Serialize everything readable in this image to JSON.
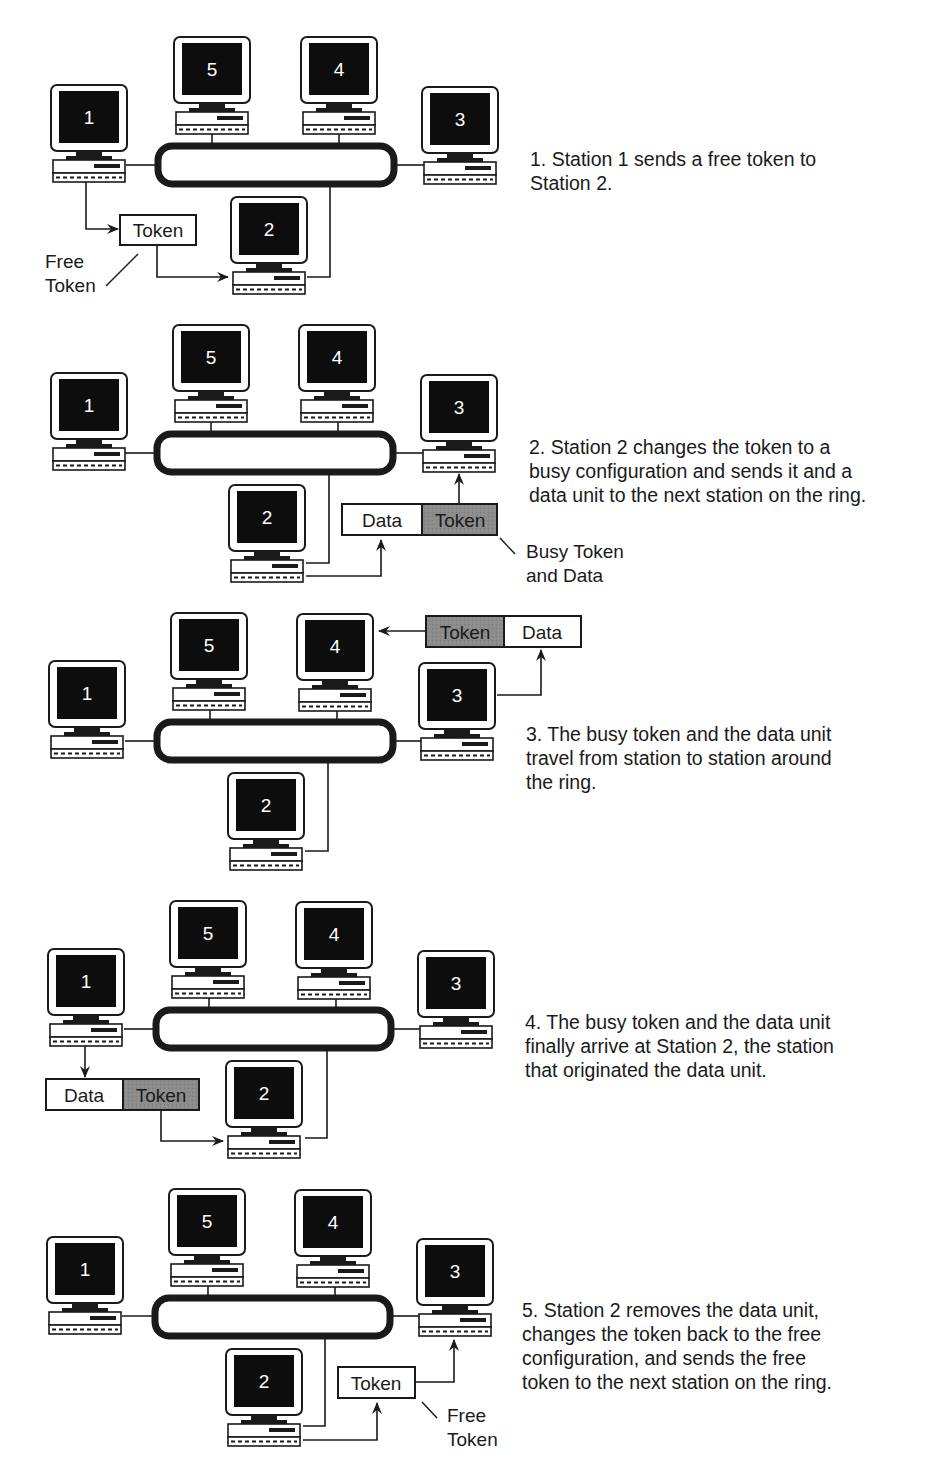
{
  "figure": {
    "colors": {
      "ink": "#1a1a1a",
      "screen": "#0d0d0d",
      "busy_token_fill": "#8c8c8c",
      "free_token_fill": "#ffffff",
      "background": "#ffffff"
    },
    "station_labels": [
      "1",
      "2",
      "3",
      "4",
      "5"
    ]
  },
  "steps": [
    {
      "caption": "1. Station 1 sends a free token to\nStation 2.",
      "boxes": [
        {
          "label": "Token",
          "kind": "free"
        }
      ],
      "annotation": "Free\nToken"
    },
    {
      "caption": "2. Station 2 changes the token to a\nbusy configuration and sends it and a\ndata unit to the next station on the ring.",
      "boxes": [
        {
          "label": "Data",
          "kind": "data"
        },
        {
          "label": "Token",
          "kind": "busy"
        }
      ],
      "annotation": "Busy Token\nand Data"
    },
    {
      "caption": "3. The busy token and the data unit\ntravel from station to station around\nthe ring.",
      "boxes": [
        {
          "label": "Token",
          "kind": "busy"
        },
        {
          "label": "Data",
          "kind": "data"
        }
      ]
    },
    {
      "caption": "4. The busy token and the data unit\nfinally arrive at Station 2, the station\nthat originated the data unit.",
      "boxes": [
        {
          "label": "Data",
          "kind": "data"
        },
        {
          "label": "Token",
          "kind": "busy"
        }
      ]
    },
    {
      "caption": "5. Station 2 removes the data unit,\nchanges the token back to the free\nconfiguration, and sends the free\ntoken to the next station on the ring.",
      "boxes": [
        {
          "label": "Token",
          "kind": "free"
        }
      ],
      "annotation": "Free\nToken"
    }
  ]
}
